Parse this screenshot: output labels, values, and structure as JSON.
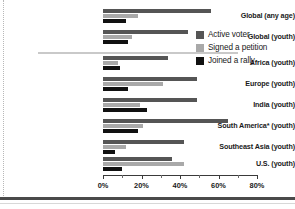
{
  "chart_data": {
    "type": "bar",
    "orientation": "horizontal",
    "title": "",
    "xlabel": "",
    "ylabel": "",
    "xlim": [
      0,
      80
    ],
    "xticks": [
      0,
      20,
      40,
      60,
      80
    ],
    "xtick_labels": [
      "0%",
      "20%",
      "40%",
      "60%",
      "80%"
    ],
    "grid": false,
    "legend_position": "right",
    "categories": [
      "Global (any age)",
      "Global (youth)",
      "Africa (youth)",
      "Europe (youth)",
      "India (youth)",
      "South America* (youth)",
      "Southeast Asia (youth)",
      "U.S. (youth)"
    ],
    "series": [
      {
        "name": "Active voter",
        "color": "#555555",
        "values": [
          56,
          44,
          34,
          49,
          49,
          65,
          42,
          36
        ]
      },
      {
        "name": "Signed a petition",
        "color": "#a9a9a9",
        "values": [
          18,
          15,
          8,
          31,
          19,
          21,
          12,
          42
        ]
      },
      {
        "name": "Joined a rally",
        "color": "#111111",
        "values": [
          12,
          13,
          9,
          13,
          23,
          18,
          6,
          10
        ]
      }
    ]
  },
  "legend": {
    "items": [
      {
        "label": "Active voter",
        "color": "#555555"
      },
      {
        "label": "Signed a petition",
        "color": "#a9a9a9"
      },
      {
        "label": "Joined a rally",
        "color": "#111111"
      }
    ]
  }
}
